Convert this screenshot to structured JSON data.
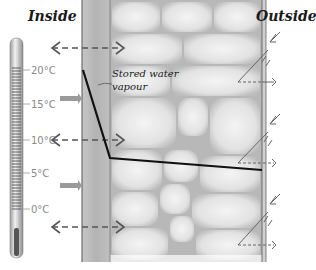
{
  "diagram": {
    "labels": {
      "inside": "Inside",
      "outside": "Outside",
      "stored_line1": "Stored water",
      "stored_line2": "vapour"
    },
    "thermometer": {
      "scale": [
        "20°C",
        "15°C",
        "10°C",
        "5°C",
        "0°C"
      ]
    },
    "temperature_profile": {
      "points": [
        [
          83,
          70
        ],
        [
          110,
          158
        ],
        [
          262,
          170
        ]
      ],
      "color": "#111111"
    },
    "colors": {
      "plaster": "#b9b9b9",
      "brick_bg": "#e4e4e4",
      "mortar": "#a8a8a8",
      "arrow": "#555555",
      "gray_arrow": "#9a9a9a"
    }
  }
}
